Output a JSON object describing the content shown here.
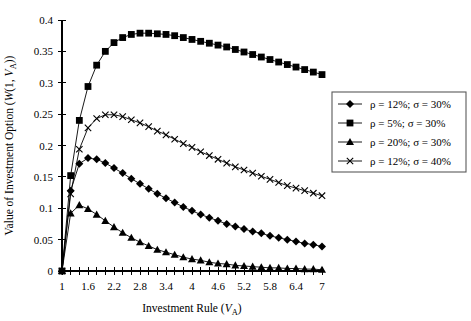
{
  "chart_data": {
    "type": "line",
    "title": "",
    "xlabel": "Investment Rule (V_A)",
    "ylabel": "Value of Investment Option (W(1, V_A))",
    "xlim": [
      1,
      7
    ],
    "ylim": [
      0,
      0.4
    ],
    "grid": false,
    "legend_position": "right",
    "x_tick_labels": [
      "1",
      "1.6",
      "2.2",
      "2.8",
      "3.4",
      "4",
      "4.6",
      "5.2",
      "5.8",
      "6.4",
      "7"
    ],
    "x_tick_values": [
      1,
      1.6,
      2.2,
      2.8,
      3.4,
      4,
      4.6,
      5.2,
      5.8,
      6.4,
      7
    ],
    "x_minor_step": 0.2,
    "y_tick_labels": [
      "0",
      "0.05",
      "0.1",
      "0.15",
      "0.2",
      "0.25",
      "0.3",
      "0.35",
      "0.4"
    ],
    "y_tick_values": [
      0,
      0.05,
      0.1,
      0.15,
      0.2,
      0.25,
      0.3,
      0.35,
      0.4
    ],
    "x": [
      1,
      1.2,
      1.4,
      1.6,
      1.8,
      2,
      2.2,
      2.4,
      2.6,
      2.8,
      3,
      3.2,
      3.4,
      3.6,
      3.8,
      4,
      4.2,
      4.4,
      4.6,
      4.8,
      5,
      5.2,
      5.4,
      5.6,
      5.8,
      6,
      6.2,
      6.4,
      6.6,
      6.8,
      7
    ],
    "series": [
      {
        "name": "rho = 12%; sigma = 30%",
        "marker": "diamond",
        "values": [
          0,
          0.128,
          0.171,
          0.18,
          0.178,
          0.172,
          0.164,
          0.156,
          0.147,
          0.139,
          0.131,
          0.123,
          0.116,
          0.109,
          0.102,
          0.096,
          0.09,
          0.085,
          0.08,
          0.075,
          0.071,
          0.067,
          0.063,
          0.06,
          0.056,
          0.053,
          0.05,
          0.047,
          0.044,
          0.042,
          0.039
        ]
      },
      {
        "name": "rho = 5%; sigma = 30%",
        "marker": "square",
        "values": [
          0,
          0.152,
          0.24,
          0.294,
          0.328,
          0.35,
          0.364,
          0.372,
          0.377,
          0.379,
          0.379,
          0.378,
          0.377,
          0.375,
          0.372,
          0.369,
          0.366,
          0.363,
          0.36,
          0.357,
          0.353,
          0.349,
          0.345,
          0.341,
          0.337,
          0.333,
          0.329,
          0.325,
          0.321,
          0.317,
          0.313
        ]
      },
      {
        "name": "rho = 20%; sigma = 30%",
        "marker": "triangle",
        "values": [
          0,
          0.092,
          0.105,
          0.099,
          0.09,
          0.08,
          0.07,
          0.061,
          0.053,
          0.046,
          0.04,
          0.034,
          0.03,
          0.026,
          0.022,
          0.019,
          0.017,
          0.014,
          0.012,
          0.011,
          0.009,
          0.008,
          0.007,
          0.006,
          0.005,
          0.005,
          0.004,
          0.004,
          0.003,
          0.003,
          0.002
        ]
      },
      {
        "name": "rho = 12%; sigma = 40%",
        "marker": "cross",
        "values": [
          0,
          0.123,
          0.194,
          0.228,
          0.243,
          0.249,
          0.249,
          0.246,
          0.241,
          0.236,
          0.23,
          0.223,
          0.217,
          0.21,
          0.203,
          0.197,
          0.19,
          0.184,
          0.178,
          0.172,
          0.166,
          0.161,
          0.156,
          0.151,
          0.146,
          0.141,
          0.136,
          0.132,
          0.128,
          0.124,
          0.12
        ]
      }
    ]
  },
  "legend": {
    "entries": [
      {
        "marker": "diamond",
        "label": "ρ = 12%; σ = 30%"
      },
      {
        "marker": "square",
        "label": "ρ = 5%; σ = 30%"
      },
      {
        "marker": "triangle",
        "label": "ρ = 20%; σ = 30%"
      },
      {
        "marker": "cross",
        "label": "ρ = 12%; σ = 40%"
      }
    ]
  },
  "axes": {
    "y_title_parts": {
      "main": "Value of Investment Option (",
      "italic_w": "W",
      "mid": "(1, ",
      "italic_v": "V",
      "sub_a": "A",
      "tail": "))"
    },
    "x_title_parts": {
      "main": "Investment Rule (",
      "italic_v": "V",
      "sub_a": "A",
      "tail": ")"
    }
  },
  "colors": {
    "ink": "#000000",
    "legend_border": "#595959",
    "background": "#ffffff"
  }
}
